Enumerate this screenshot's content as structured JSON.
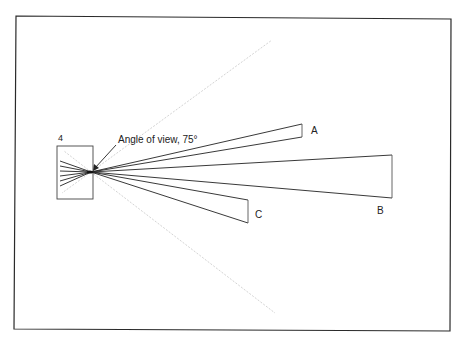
{
  "diagram": {
    "title": "",
    "frame": {
      "x1": 16,
      "y1": 15,
      "x2": 451,
      "y2": 331,
      "stroke": "#2a2a2a"
    },
    "film_box": {
      "label": "4",
      "x": 57,
      "y": 146,
      "w": 36,
      "h": 53
    },
    "focal_point": {
      "x": 91,
      "y": 172
    },
    "annotation": {
      "text": "Angle of view, 75°",
      "x": 117,
      "y": 142,
      "arrow_from": [
        116,
        145
      ],
      "arrow_to": [
        93,
        170
      ]
    },
    "view_boundaries": {
      "upper": {
        "x": 272,
        "y": 40
      },
      "lower": {
        "x": 275,
        "y": 313
      },
      "color": "#d4d4d4"
    },
    "objects": [
      {
        "label": "A",
        "near_top": [
          302,
          124
        ],
        "near_bottom": [
          302,
          137
        ],
        "label_pos": [
          311,
          134
        ]
      },
      {
        "label": "B",
        "near_top": [
          392,
          155
        ],
        "near_bottom": [
          392,
          198
        ],
        "label_pos": [
          377,
          214
        ]
      },
      {
        "label": "C",
        "near_top": [
          248,
          200
        ],
        "near_bottom": [
          248,
          223
        ],
        "label_pos": [
          255,
          218
        ]
      }
    ],
    "rear_rays": [
      {
        "x": 60,
        "y": 161
      },
      {
        "x": 60,
        "y": 166
      },
      {
        "x": 60,
        "y": 171
      },
      {
        "x": 60,
        "y": 176
      },
      {
        "x": 60,
        "y": 181
      },
      {
        "x": 60,
        "y": 186
      }
    ]
  }
}
